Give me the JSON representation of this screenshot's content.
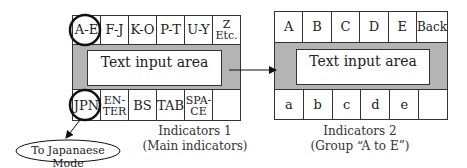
{
  "indicators1": {
    "top_row": [
      "A-E",
      "F-J",
      "K-O",
      "P-T",
      "U-Y",
      "Z\nEtc."
    ],
    "text_area_label": "Text input area",
    "bottom_row": [
      "JPN",
      "EN-\nTER",
      "BS",
      "TAB",
      "SPA-\nCE",
      ""
    ],
    "caption_line1": "Indicators 1",
    "caption_line2": "(Main indicators)",
    "highlighted": [
      "A-E",
      "JPN"
    ]
  },
  "indicators2": {
    "top_row": [
      "A",
      "B",
      "C",
      "D",
      "E",
      "Back"
    ],
    "text_area_label": "Text input area",
    "bottom_row": [
      "a",
      "b",
      "c",
      "d",
      "e",
      ""
    ],
    "caption_line1": "Indicators 2",
    "caption_line2": "(Group “A to E”)"
  },
  "japanese_mode": {
    "label": "To Japanaese Mode"
  },
  "colors": {
    "gray_band": "#b4b4b4",
    "stroke": "#333333"
  }
}
